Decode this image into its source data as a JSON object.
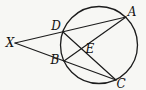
{
  "figure": {
    "background_color": "#f7f7f4",
    "stroke_color": "#1c1c1c",
    "labels": {
      "x": "X",
      "d": "D",
      "b": "B",
      "e": "E",
      "a": "A",
      "c": "C"
    }
  }
}
